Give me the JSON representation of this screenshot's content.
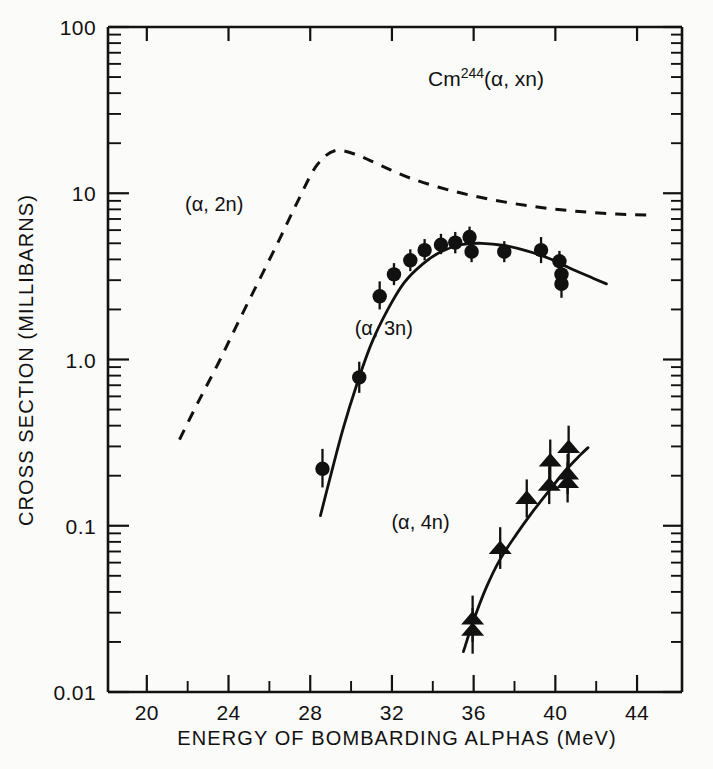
{
  "figure": {
    "title": "Cm",
    "title_sup": "244",
    "title_rest": "(α, xn)",
    "background_color": "#fbfbf9",
    "ink_color": "#111111"
  },
  "axes": {
    "x_title": "ENERGY OF BOMBARDING ALPHAS (MeV)",
    "y_title": "CROSS SECTION (MILLIBARNS)",
    "x_ticks": [
      "20",
      "24",
      "28",
      "32",
      "36",
      "40",
      "44"
    ],
    "x_tick_values": [
      20,
      24,
      28,
      32,
      36,
      40,
      44
    ],
    "x_minor_values": [
      22,
      26,
      30,
      34,
      38,
      42
    ],
    "y_ticks": [
      "100",
      "10",
      "1.0",
      "0.1",
      "0.01"
    ],
    "y_tick_values": [
      100,
      10,
      1.0,
      0.1,
      0.01
    ]
  },
  "chart_data": {
    "type": "line",
    "title": "Cm244(α, xn)",
    "xlabel": "ENERGY OF BOMBARDING ALPHAS (MeV)",
    "ylabel": "CROSS SECTION (MILLIBARNS)",
    "xlim": [
      18.1,
      46.2
    ],
    "ylim": [
      0.01,
      100
    ],
    "yscale": "log",
    "xscale": "linear",
    "grid": false,
    "legend": "inline-labels",
    "series": [
      {
        "name": "(α, 2n)",
        "style": "dashed",
        "markers": "none",
        "label_x": 23.3,
        "label_y": 8.6,
        "x": [
          21.6,
          22.5,
          23.5,
          24.5,
          25.5,
          26.5,
          27.4,
          28.3,
          29.2,
          30.3,
          31.5,
          33.0,
          35.0,
          37.0,
          39.0,
          41.0,
          43.0,
          44.6
        ],
        "y": [
          0.33,
          0.55,
          0.95,
          1.7,
          3.0,
          5.3,
          9.0,
          14.6,
          18.0,
          17.0,
          14.6,
          12.2,
          10.3,
          9.1,
          8.3,
          7.8,
          7.5,
          7.4
        ]
      },
      {
        "name": "(α, 3n)",
        "style": "solid",
        "markers": "circle",
        "label_x": 31.6,
        "label_y": 1.55,
        "curve_x": [
          28.5,
          29.0,
          29.6,
          30.3,
          31.0,
          31.8,
          32.6,
          33.5,
          34.4,
          35.4,
          36.4,
          37.5,
          38.6,
          39.7,
          40.8,
          41.8,
          42.5
        ],
        "curve_y": [
          0.115,
          0.2,
          0.38,
          0.72,
          1.25,
          2.0,
          2.9,
          3.75,
          4.45,
          4.9,
          5.0,
          4.85,
          4.5,
          4.05,
          3.5,
          3.1,
          2.85
        ],
        "points": [
          {
            "x": 28.6,
            "y": 0.22,
            "err_lo": 0.17,
            "err_hi": 0.29
          },
          {
            "x": 30.4,
            "y": 0.78,
            "err_lo": 0.63,
            "err_hi": 0.97
          },
          {
            "x": 31.4,
            "y": 2.4,
            "err_lo": 2.0,
            "err_hi": 2.95
          },
          {
            "x": 32.1,
            "y": 3.25,
            "err_lo": 2.8,
            "err_hi": 3.8
          },
          {
            "x": 32.9,
            "y": 3.95,
            "err_lo": 3.4,
            "err_hi": 4.6
          },
          {
            "x": 33.6,
            "y": 4.55,
            "err_lo": 3.95,
            "err_hi": 5.3
          },
          {
            "x": 34.4,
            "y": 4.9,
            "err_lo": 4.3,
            "err_hi": 5.7
          },
          {
            "x": 35.1,
            "y": 5.05,
            "err_lo": 4.35,
            "err_hi": 5.85
          },
          {
            "x": 35.8,
            "y": 5.45,
            "err_lo": 4.75,
            "err_hi": 6.3
          },
          {
            "x": 35.9,
            "y": 4.45,
            "err_lo": 3.85,
            "err_hi": 5.15
          },
          {
            "x": 37.5,
            "y": 4.45,
            "err_lo": 3.85,
            "err_hi": 5.15
          },
          {
            "x": 39.3,
            "y": 4.55,
            "err_lo": 3.8,
            "err_hi": 5.45
          },
          {
            "x": 40.2,
            "y": 3.9,
            "err_lo": 3.35,
            "err_hi": 4.5
          },
          {
            "x": 40.3,
            "y": 3.25,
            "err_lo": 2.8,
            "err_hi": 3.75
          },
          {
            "x": 40.3,
            "y": 2.85,
            "err_lo": 2.35,
            "err_hi": 3.4
          }
        ]
      },
      {
        "name": "(α, 4n)",
        "style": "solid",
        "markers": "triangle",
        "label_x": 33.4,
        "label_y": 0.105,
        "curve_x": [
          35.5,
          36.0,
          36.6,
          37.3,
          38.1,
          38.9,
          39.7,
          40.5,
          41.2,
          41.6
        ],
        "curve_y": [
          0.0175,
          0.027,
          0.042,
          0.063,
          0.089,
          0.122,
          0.163,
          0.215,
          0.265,
          0.295
        ],
        "points": [
          {
            "x": 35.95,
            "y": 0.0235,
            "err_lo": 0.017,
            "err_hi": 0.032
          },
          {
            "x": 35.95,
            "y": 0.0275,
            "err_lo": 0.02,
            "err_hi": 0.038
          },
          {
            "x": 37.3,
            "y": 0.073,
            "err_lo": 0.055,
            "err_hi": 0.098
          },
          {
            "x": 38.6,
            "y": 0.146,
            "err_lo": 0.112,
            "err_hi": 0.19
          },
          {
            "x": 39.7,
            "y": 0.175,
            "err_lo": 0.135,
            "err_hi": 0.228
          },
          {
            "x": 39.75,
            "y": 0.245,
            "err_lo": 0.185,
            "err_hi": 0.33
          },
          {
            "x": 40.6,
            "y": 0.182,
            "err_lo": 0.138,
            "err_hi": 0.24
          },
          {
            "x": 40.6,
            "y": 0.205,
            "err_lo": 0.155,
            "err_hi": 0.27
          },
          {
            "x": 40.65,
            "y": 0.295,
            "err_lo": 0.215,
            "err_hi": 0.4
          }
        ]
      }
    ]
  }
}
